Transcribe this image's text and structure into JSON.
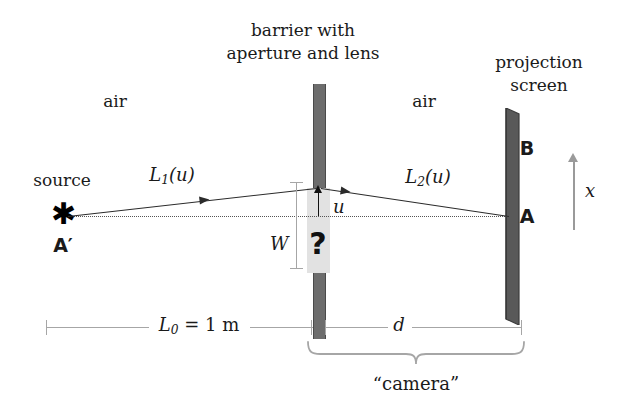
{
  "figure": {
    "type": "optics-ray-diagram"
  },
  "labels": {
    "barrier_title_line1": "barrier with",
    "barrier_title_line2": "aperture and lens",
    "screen_title_line1": "projection",
    "screen_title_line2": "screen",
    "air_left": "air",
    "air_right": "air",
    "source": "source",
    "source_point": "A′",
    "screen_point_top": "B",
    "screen_point_axis": "A",
    "ray_in": "L",
    "ray_in_sub": "1",
    "ray_in_arg": "(u)",
    "ray_out": "L",
    "ray_out_sub": "2",
    "ray_out_arg": "(u)",
    "aperture_coord": "u",
    "aperture_width": "W",
    "unknown": "?",
    "transverse_axis": "x",
    "camera": "“camera”"
  },
  "dimensions": {
    "object_distance_symbol": "L",
    "object_distance_sub": "0",
    "object_distance_value": "= 1 m",
    "object_distance_full": "L₀ = 1 m",
    "image_distance": "d"
  },
  "colors": {
    "ink": "#1a1a1a",
    "barrier": "#6d6d6d",
    "barrier_edge": "#4a4a4a",
    "aperture_fill": "#e2e2e2",
    "screen": "#595959",
    "screen_edge": "#3d3d3d",
    "ray": "#2b2b2b",
    "axis_dotted": "#555555",
    "dimension_gray": "#a6a6a6",
    "x_axis_gray": "#9a9a9a",
    "background": "#ffffff"
  }
}
